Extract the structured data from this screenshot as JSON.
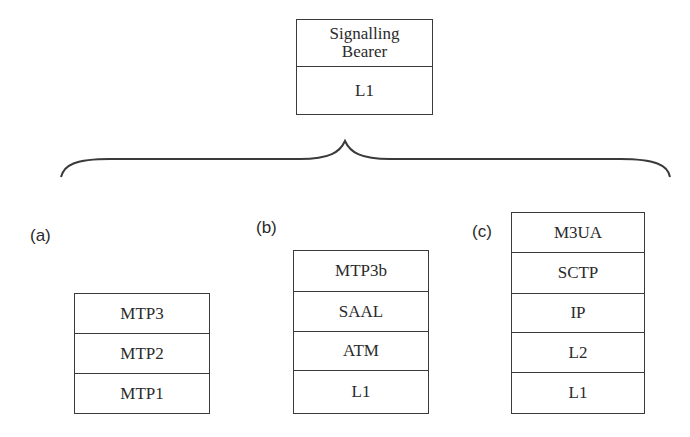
{
  "top_stack": {
    "layers": [
      "Signalling\nBearer",
      "L1"
    ],
    "layer_lines": [
      [
        "Signalling",
        "Bearer"
      ],
      [
        "L1"
      ]
    ]
  },
  "stacks": [
    {
      "label": "(a)",
      "layers": [
        "MTP3",
        "MTP2",
        "MTP1"
      ]
    },
    {
      "label": "(b)",
      "layers": [
        "MTP3b",
        "SAAL",
        "ATM",
        "L1"
      ]
    },
    {
      "label": "(c)",
      "layers": [
        "M3UA",
        "SCTP",
        "IP",
        "L2",
        "L1"
      ]
    }
  ],
  "colors": {
    "line": "#3a3a3a",
    "text": "#2a2a2a",
    "background": "#ffffff"
  }
}
